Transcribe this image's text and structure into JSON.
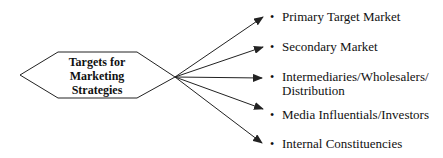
{
  "center": {
    "lines": [
      "Targets for",
      "Marketing",
      "Strategies"
    ]
  },
  "targets": [
    {
      "label": "Primary Target Market",
      "top": 10
    },
    {
      "label": "Secondary Market",
      "top": 40
    },
    {
      "label": "Intermediaries/Wholesalers/ Distribution",
      "top": 70
    },
    {
      "label": "Media Influentials/Investors",
      "top": 108
    },
    {
      "label": "Internal Constituencies",
      "top": 137
    }
  ],
  "colors": {
    "line": "#222222",
    "text": "#111111"
  }
}
